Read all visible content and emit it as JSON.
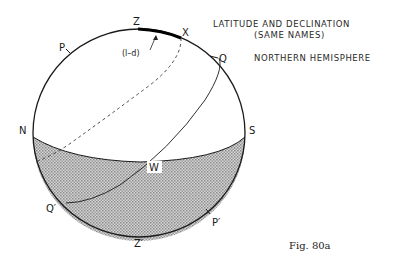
{
  "figure": {
    "title_line1": "LATITUDE AND DECLINATION",
    "title_line2": "(SAME NAMES)",
    "subtitle": "NORTHERN HEMISPHERE",
    "caption": "Fig. 80a"
  },
  "labels": {
    "zenith": "Z",
    "star": "X",
    "arc_note": "(l–d)",
    "pole": "P",
    "equator_top": "Q",
    "north": "N",
    "south": "S",
    "west": "W",
    "equator_bottom": "Q′",
    "nadir": "Z′",
    "pole_below": "P′"
  },
  "colors": {
    "line": "#1a1a1a",
    "shade": "#b5b5b5",
    "background": "#ffffff"
  }
}
